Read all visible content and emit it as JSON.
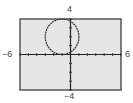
{
  "chart_data": {
    "type": "line",
    "title": "",
    "equation": "(x+1)^2 + (y-2)^2 = 4",
    "series": [
      {
        "name": "circle",
        "center": [
          -1,
          2
        ],
        "radius": 2
      }
    ],
    "xlim": [
      -6,
      6
    ],
    "ylim": [
      -4,
      4
    ],
    "xscale": 1,
    "yscale": 1,
    "xlabel": "",
    "ylabel": "",
    "tick_labels": {
      "xmin": "−6",
      "xmax": "6",
      "ymin": "−4",
      "ymax": "4"
    },
    "grid": false,
    "legend": null
  },
  "window": {
    "xmin_label": "−6",
    "xmax_label": "6",
    "ymin_label": "−4",
    "ymax_label": "4"
  },
  "colors": {
    "screen_bg": "#e6e6e6",
    "frame": "#555555",
    "axes": "#222222",
    "curve": "#333333"
  }
}
